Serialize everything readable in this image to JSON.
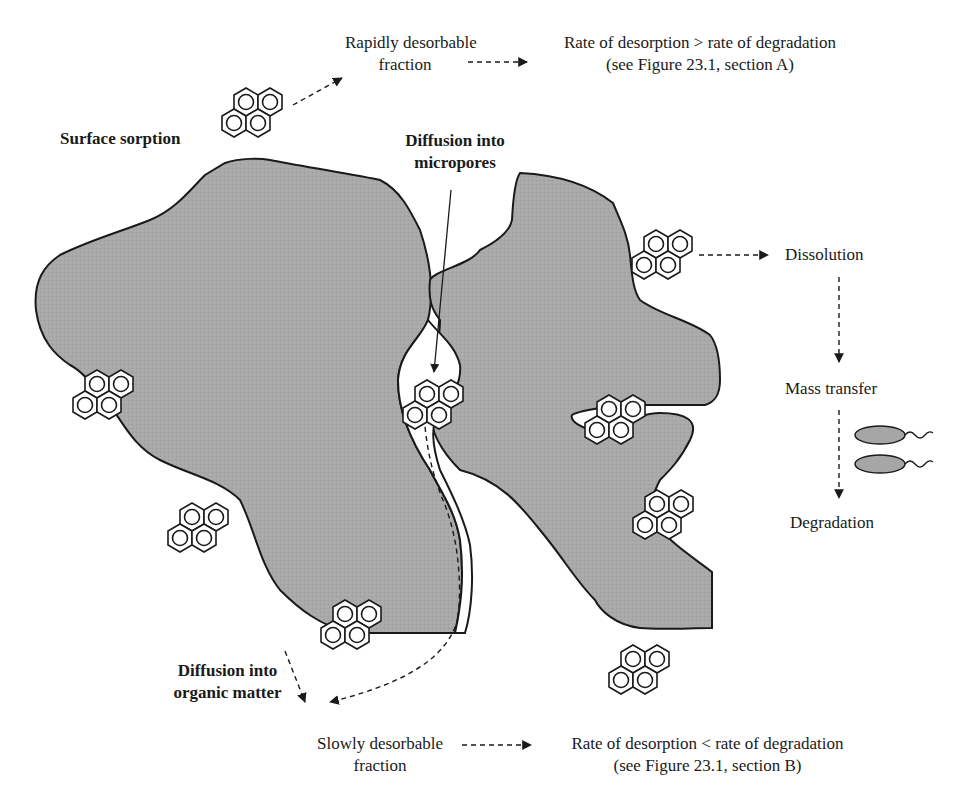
{
  "diagram": {
    "labels": {
      "rapid_fraction": [
        "Rapidly desorbable",
        "fraction"
      ],
      "rate_gt": [
        "Rate of desorption > rate of degradation",
        "(see Figure 23.1, section A)"
      ],
      "surface_sorption": "Surface sorption",
      "diffusion_micropores": [
        "Diffusion into",
        "micropores"
      ],
      "dissolution": "Dissolution",
      "mass_transfer": "Mass transfer",
      "degradation": "Degradation",
      "diffusion_organic": [
        "Diffusion into",
        "organic matter"
      ],
      "slow_fraction": [
        "Slowly desorbable",
        "fraction"
      ],
      "rate_lt": [
        "Rate of desorption < rate of degradation",
        "(see Figure 23.1, section B)"
      ]
    },
    "colors": {
      "particle_fill": "#a9a9a9",
      "outline": "#1a1a1a",
      "bacteria_fill": "#a6a6a6"
    },
    "icons": {
      "molecule": "pyrene-molecule-icon",
      "bacterium": "bacterium-icon"
    }
  }
}
